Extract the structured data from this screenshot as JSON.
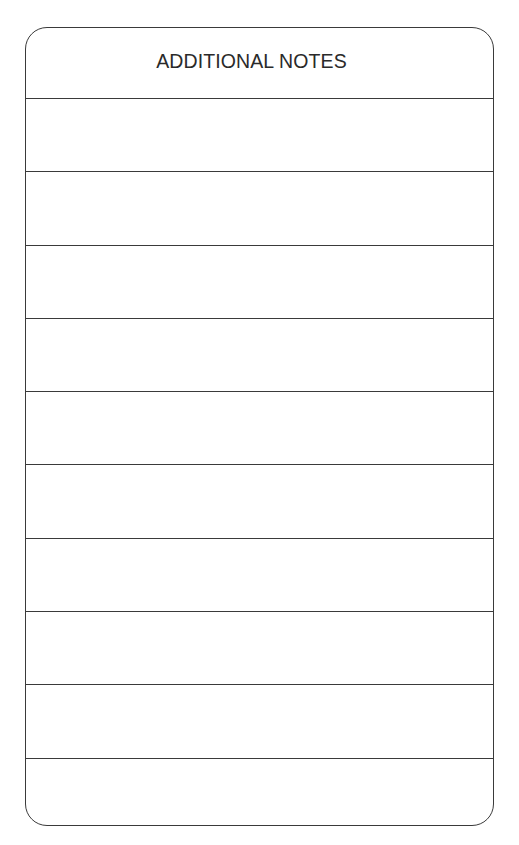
{
  "form": {
    "title": "ADDITIONAL NOTES",
    "rows": [
      {
        "value": ""
      },
      {
        "value": ""
      },
      {
        "value": ""
      },
      {
        "value": ""
      },
      {
        "value": ""
      },
      {
        "value": ""
      },
      {
        "value": ""
      },
      {
        "value": ""
      },
      {
        "value": ""
      },
      {
        "value": ""
      }
    ]
  },
  "colors": {
    "border": "#3a3a3a",
    "text": "#2a2a2a",
    "background": "#ffffff"
  }
}
